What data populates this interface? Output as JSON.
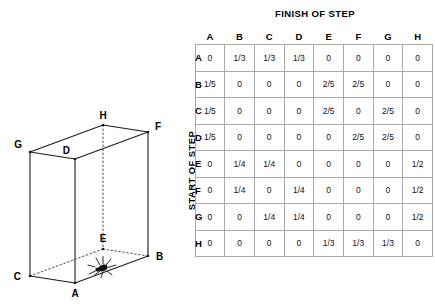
{
  "diagram": {
    "name": "cube-with-spider",
    "caption": "",
    "vertices": [
      {
        "id": "A",
        "label": "A"
      },
      {
        "id": "B",
        "label": "B"
      },
      {
        "id": "C",
        "label": "C"
      },
      {
        "id": "D",
        "label": "D"
      },
      {
        "id": "E",
        "label": "E"
      },
      {
        "id": "F",
        "label": "F"
      },
      {
        "id": "G",
        "label": "G"
      },
      {
        "id": "H",
        "label": "H"
      }
    ],
    "spider_label": "spider"
  },
  "matrix": {
    "column_axis_title": "FINISH OF STEP",
    "row_axis_title": "START OF STEP",
    "column_headers": [
      "A",
      "B",
      "C",
      "D",
      "E",
      "F",
      "G",
      "H"
    ],
    "row_headers": [
      "A",
      "B",
      "C",
      "D",
      "E",
      "F",
      "G",
      "H"
    ],
    "rows": [
      {
        "header": "A",
        "values": [
          "0",
          "1/3",
          "1/3",
          "1/3",
          "0",
          "0",
          "0",
          "0"
        ]
      },
      {
        "header": "B",
        "values": [
          "1/5",
          "0",
          "0",
          "0",
          "2/5",
          "2/5",
          "0",
          "0"
        ]
      },
      {
        "header": "C",
        "values": [
          "1/5",
          "0",
          "0",
          "0",
          "2/5",
          "0",
          "2/5",
          "0"
        ]
      },
      {
        "header": "D",
        "values": [
          "1/5",
          "0",
          "0",
          "0",
          "0",
          "2/5",
          "2/5",
          "0"
        ]
      },
      {
        "header": "E",
        "values": [
          "0",
          "1/4",
          "1/4",
          "0",
          "0",
          "0",
          "0",
          "1/2"
        ]
      },
      {
        "header": "F",
        "values": [
          "0",
          "1/4",
          "0",
          "1/4",
          "0",
          "0",
          "0",
          "1/2"
        ]
      },
      {
        "header": "G",
        "values": [
          "0",
          "0",
          "1/4",
          "1/4",
          "0",
          "0",
          "0",
          "1/2"
        ]
      },
      {
        "header": "H",
        "values": [
          "0",
          "0",
          "0",
          "0",
          "1/3",
          "1/3",
          "1/3",
          "0"
        ]
      }
    ]
  }
}
